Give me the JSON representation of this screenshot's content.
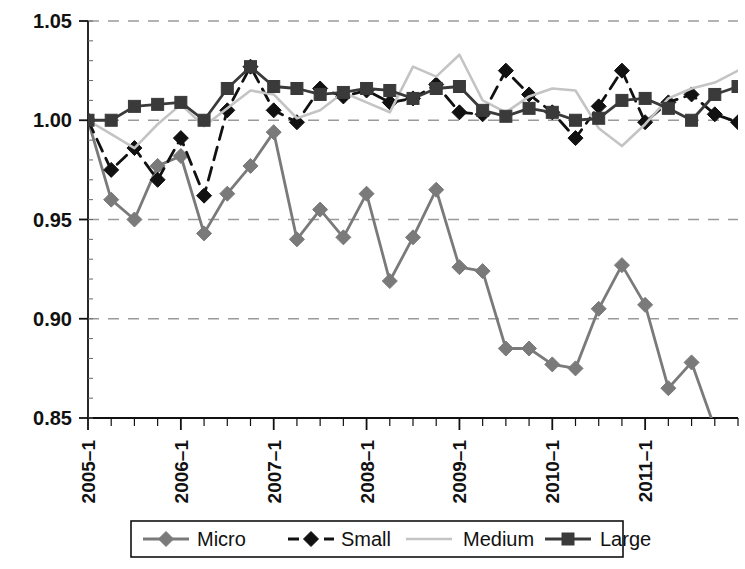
{
  "chart_data": {
    "type": "line",
    "title": "",
    "subtitle": "",
    "xlabel": "",
    "ylabel": "",
    "grid": true,
    "grid_style": "dashed-horizontal",
    "legend_position": "bottom",
    "ylim": [
      0.85,
      1.05
    ],
    "ytick_labels": [
      "1.05",
      "1.00",
      "0.95",
      "0.90",
      "0.85"
    ],
    "ytick_values": [
      1.05,
      1.0,
      0.95,
      0.9,
      0.85
    ],
    "xtick_labels": [
      "2005–1",
      "2006–1",
      "2007–1",
      "2008–1",
      "2009–1",
      "2010–1",
      "2011–1"
    ],
    "xtick_values": [
      "2005-1",
      "2006-1",
      "2007-1",
      "2008-1",
      "2009-1",
      "2010-1",
      "2011-1"
    ],
    "x": [
      "2005-1",
      "2005-2",
      "2005-3",
      "2005-4",
      "2006-1",
      "2006-2",
      "2006-3",
      "2006-4",
      "2007-1",
      "2007-2",
      "2007-3",
      "2007-4",
      "2008-1",
      "2008-2",
      "2008-3",
      "2008-4",
      "2009-1",
      "2009-2",
      "2009-3",
      "2009-4",
      "2010-1",
      "2010-2",
      "2010-3",
      "2010-4",
      "2011-1",
      "2011-2",
      "2011-3",
      "2011-4",
      "2012-1"
    ],
    "series": [
      {
        "name": "Micro",
        "color": "#7a7a7a",
        "marker": "diamond",
        "line_style": "solid",
        "values": [
          1.0,
          0.96,
          0.95,
          0.977,
          0.982,
          0.943,
          0.963,
          0.977,
          0.994,
          0.94,
          0.955,
          0.941,
          0.963,
          0.919,
          0.941,
          0.965,
          0.926,
          0.924,
          0.885,
          0.885,
          0.877,
          0.875,
          0.905,
          0.927,
          0.907,
          0.865,
          0.878,
          0.845,
          0.8
        ]
      },
      {
        "name": "Small",
        "color": "#111111",
        "marker": "diamond",
        "line_style": "dashed",
        "values": [
          1.0,
          0.975,
          0.986,
          0.97,
          0.991,
          0.962,
          1.005,
          1.027,
          1.005,
          0.999,
          1.016,
          1.012,
          1.015,
          1.009,
          1.011,
          1.018,
          1.004,
          1.003,
          1.025,
          1.013,
          1.004,
          0.991,
          1.007,
          1.025,
          0.999,
          1.009,
          1.013,
          1.003,
          0.999
        ]
      },
      {
        "name": "Medium",
        "color": "#c4c4c4",
        "marker": "none",
        "line_style": "solid",
        "values": [
          1.0,
          0.993,
          0.986,
          0.998,
          1.008,
          0.997,
          1.006,
          1.015,
          1.013,
          1.001,
          1.005,
          1.014,
          1.009,
          1.004,
          1.027,
          1.022,
          1.033,
          1.01,
          1.004,
          1.012,
          1.016,
          1.015,
          0.996,
          0.987,
          0.998,
          1.011,
          1.016,
          1.019,
          1.025
        ]
      },
      {
        "name": "Large",
        "color": "#3a3a3a",
        "marker": "square",
        "line_style": "solid",
        "values": [
          1.0,
          1.0,
          1.007,
          1.008,
          1.009,
          1.0,
          1.016,
          1.027,
          1.017,
          1.016,
          1.013,
          1.014,
          1.016,
          1.015,
          1.011,
          1.016,
          1.017,
          1.005,
          1.002,
          1.006,
          1.004,
          1.0,
          1.001,
          1.01,
          1.011,
          1.006,
          1.0,
          1.013,
          1.017
        ]
      }
    ]
  },
  "legend": {
    "items": [
      {
        "label": "Micro"
      },
      {
        "label": "Small"
      },
      {
        "label": "Medium"
      },
      {
        "label": "Large"
      }
    ]
  }
}
